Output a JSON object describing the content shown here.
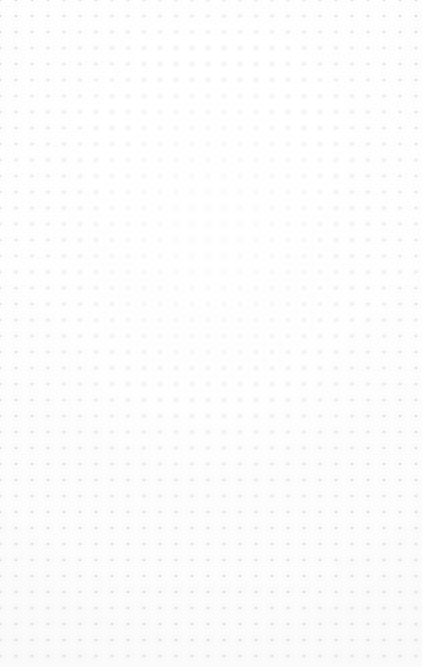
{
  "canvas": {
    "name": "blank-dot-grid-canvas",
    "state_label": "",
    "width": 422,
    "height": 667,
    "background_color": "#fdfdfd",
    "background_top_color": "#fefefe",
    "background_bottom_color": "#fafafa",
    "content": {
      "has_text": false,
      "has_icons": false,
      "has_toolbar": false,
      "items": []
    },
    "grid": {
      "type": "dot",
      "visible": true,
      "spacing_px": 16,
      "origin_x_px": 8,
      "origin_y_px": 8,
      "dot_radius_px": 1.3,
      "dot_color": "#c4c4cb",
      "halo_color": "#e7e7ec",
      "columns": 26,
      "rows": 42
    }
  }
}
